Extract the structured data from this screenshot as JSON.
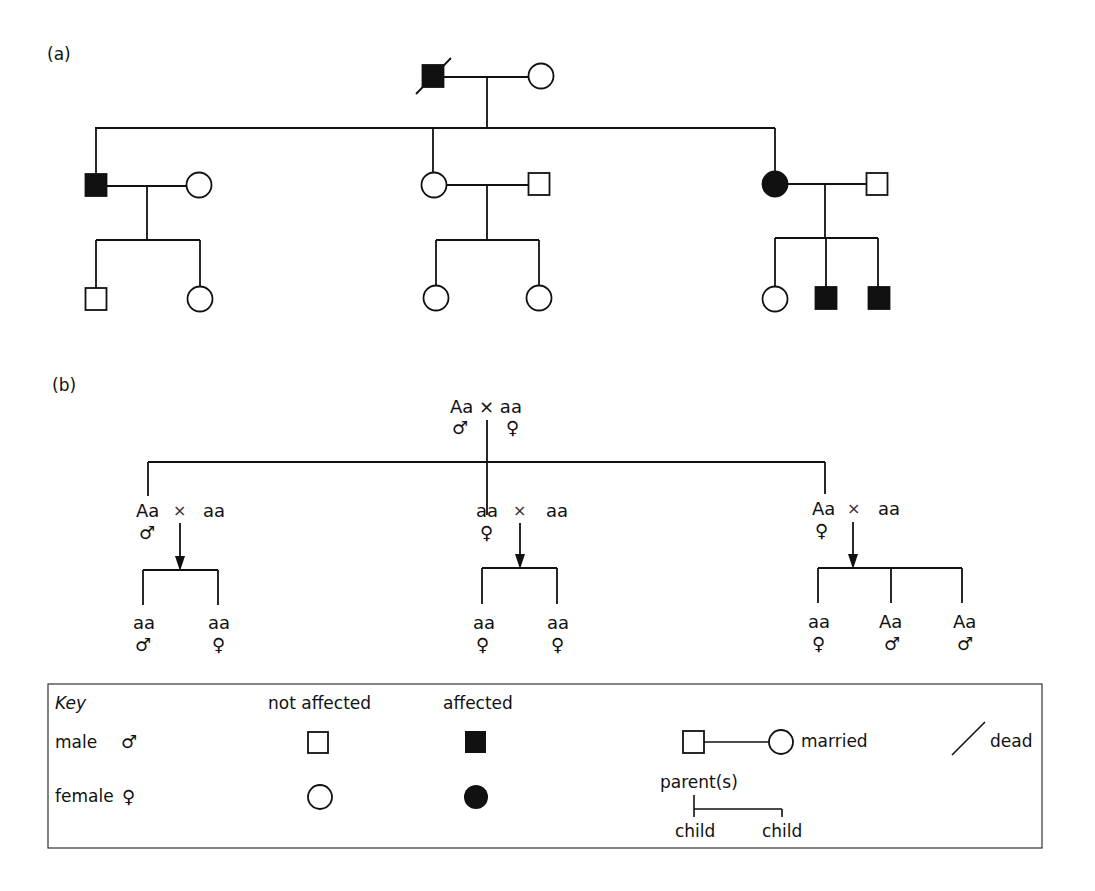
{
  "panels": {
    "a": {
      "label": "(a)"
    },
    "b": {
      "label": "(b)"
    }
  },
  "pedigree_a": {
    "generation_1": [
      {
        "id": "I-1",
        "sex": "male",
        "affected": true,
        "dead": true,
        "x": 433,
        "y": 76
      },
      {
        "id": "I-2",
        "sex": "female",
        "affected": false,
        "dead": false,
        "x": 541,
        "y": 76
      }
    ],
    "generation_2": [
      {
        "id": "II-1",
        "sex": "male",
        "affected": true,
        "x": 96,
        "y": 185
      },
      {
        "id": "II-2",
        "sex": "female",
        "affected": false,
        "x": 199,
        "y": 185
      },
      {
        "id": "II-3",
        "sex": "female",
        "affected": false,
        "x": 434,
        "y": 185
      },
      {
        "id": "II-4",
        "sex": "male",
        "affected": false,
        "x": 539,
        "y": 184
      },
      {
        "id": "II-5",
        "sex": "female",
        "affected": true,
        "x": 775,
        "y": 184
      },
      {
        "id": "II-6",
        "sex": "male",
        "affected": false,
        "x": 877,
        "y": 184
      }
    ],
    "generation_3": [
      {
        "id": "III-1",
        "sex": "male",
        "affected": false,
        "x": 96,
        "y": 299
      },
      {
        "id": "III-2",
        "sex": "female",
        "affected": false,
        "x": 200,
        "y": 299
      },
      {
        "id": "III-3",
        "sex": "female",
        "affected": false,
        "x": 436,
        "y": 298
      },
      {
        "id": "III-4",
        "sex": "female",
        "affected": false,
        "x": 539,
        "y": 298
      },
      {
        "id": "III-5",
        "sex": "female",
        "affected": false,
        "x": 775,
        "y": 299
      },
      {
        "id": "III-6",
        "sex": "male",
        "affected": true,
        "x": 826,
        "y": 298
      },
      {
        "id": "III-7",
        "sex": "male",
        "affected": true,
        "x": 879,
        "y": 298
      }
    ]
  },
  "pedigree_b": {
    "top": {
      "text": "Aa × aa",
      "male_symbol": "♂",
      "female_symbol": "♀"
    },
    "families": [
      {
        "parent1": "Aa",
        "parent1_sex": "♂",
        "cross": "×",
        "parent2": "aa",
        "children": [
          {
            "genotype": "aa",
            "sex": "♂"
          },
          {
            "genotype": "aa",
            "sex": "♀"
          }
        ]
      },
      {
        "parent1": "aa",
        "parent1_sex": "♀",
        "cross": "×",
        "parent2": "aa",
        "children": [
          {
            "genotype": "aa",
            "sex": "♀"
          },
          {
            "genotype": "aa",
            "sex": "♀"
          }
        ]
      },
      {
        "parent1": "Aa",
        "parent1_sex": "♀",
        "cross": "×",
        "parent2": "aa",
        "children": [
          {
            "genotype": "aa",
            "sex": "♀"
          },
          {
            "genotype": "Aa",
            "sex": "♂"
          },
          {
            "genotype": "Aa",
            "sex": "♂"
          }
        ]
      }
    ]
  },
  "key": {
    "title": "Key",
    "male_label": "male",
    "male_symbol": "♂",
    "female_label": "female",
    "female_symbol": "♀",
    "not_affected_label": "not affected",
    "affected_label": "affected",
    "married_label": "married",
    "dead_label": "dead",
    "parents_label": "parent(s)",
    "child_label_1": "child",
    "child_label_2": "child"
  }
}
